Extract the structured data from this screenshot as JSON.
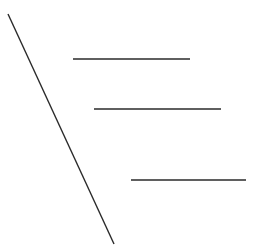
{
  "canvas": {
    "width": 260,
    "height": 247,
    "background": "#ffffff"
  },
  "stroke": {
    "color": "#2a2a2a",
    "width": 1.4
  },
  "lines": [
    {
      "id": "diagonal",
      "x1": 8,
      "y1": 14,
      "x2": 114,
      "y2": 244
    },
    {
      "id": "horizontal-1",
      "x1": 73,
      "y1": 59,
      "x2": 190,
      "y2": 59
    },
    {
      "id": "horizontal-2",
      "x1": 94,
      "y1": 109,
      "x2": 221,
      "y2": 109
    },
    {
      "id": "horizontal-3",
      "x1": 131,
      "y1": 180,
      "x2": 246,
      "y2": 180
    }
  ]
}
